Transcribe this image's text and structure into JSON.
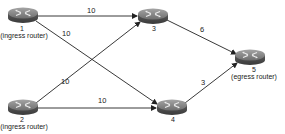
{
  "diagram": {
    "type": "network-topology",
    "nodes": [
      {
        "id": "1",
        "label": "1",
        "role": "(ingress router)",
        "x": 23,
        "y": 15,
        "label_x": 22,
        "label_y": 25,
        "role_x": 24,
        "role_y": 33
      },
      {
        "id": "2",
        "label": "2",
        "role": "(ingress router)",
        "x": 23,
        "y": 107,
        "label_x": 22,
        "label_y": 116,
        "role_x": 24,
        "role_y": 124
      },
      {
        "id": "3",
        "label": "3",
        "role": "",
        "x": 153,
        "y": 16,
        "label_x": 154,
        "label_y": 25,
        "role_x": 0,
        "role_y": 0
      },
      {
        "id": "4",
        "label": "4",
        "role": "",
        "x": 172,
        "y": 107,
        "label_x": 173,
        "label_y": 116,
        "role_x": 0,
        "role_y": 0
      },
      {
        "id": "5",
        "label": "5",
        "role": "(egress router)",
        "x": 250,
        "y": 57,
        "label_x": 254,
        "label_y": 67,
        "role_x": 254,
        "role_y": 74
      }
    ],
    "edges": [
      {
        "from": "1",
        "to": "3",
        "weight": "10",
        "label_x": 88,
        "label_y": 7
      },
      {
        "from": "1",
        "to": "4",
        "weight": "10",
        "label_x": 62,
        "label_y": 30
      },
      {
        "from": "2",
        "to": "3",
        "weight": "10",
        "label_x": 62,
        "label_y": 79
      },
      {
        "from": "2",
        "to": "4",
        "weight": "10",
        "label_x": 98,
        "label_y": 97
      },
      {
        "from": "3",
        "to": "5",
        "weight": "6",
        "label_x": 200,
        "label_y": 27
      },
      {
        "from": "4",
        "to": "5",
        "weight": "3",
        "label_x": 201,
        "label_y": 80
      }
    ]
  },
  "colors": {
    "line": "#222222",
    "router_top": "#8a8a8a",
    "router_side": "#555555",
    "router_mark": "#e6e6e6"
  }
}
